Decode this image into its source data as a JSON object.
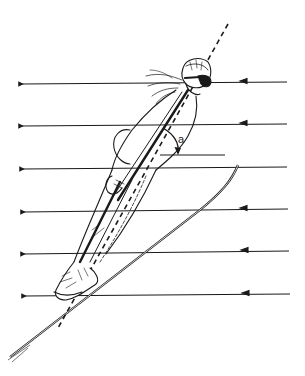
{
  "diagram": {
    "type": "ski-jumper-airflow-illustration",
    "angle_label": "a",
    "corner_mark": "",
    "colors": {
      "stroke": "#1a1a1a",
      "background": "#ffffff"
    },
    "airflow_arrows": [
      {
        "y_right": 82,
        "y_left": 84
      },
      {
        "y_right": 124,
        "y_left": 126
      },
      {
        "y_right": 167,
        "y_left": 169
      },
      {
        "y_right": 209,
        "y_left": 212
      },
      {
        "y_right": 251,
        "y_left": 254
      },
      {
        "y_right": 294,
        "y_left": 296
      }
    ],
    "body_axis": {
      "style": "dashed",
      "top": [
        228,
        24
      ],
      "bottom": [
        60,
        330
      ]
    },
    "reference_line": {
      "from": [
        160,
        155
      ],
      "to": [
        225,
        155
      ]
    },
    "ski": {
      "tip": [
        238,
        165
      ],
      "tail": [
        8,
        358
      ]
    }
  }
}
